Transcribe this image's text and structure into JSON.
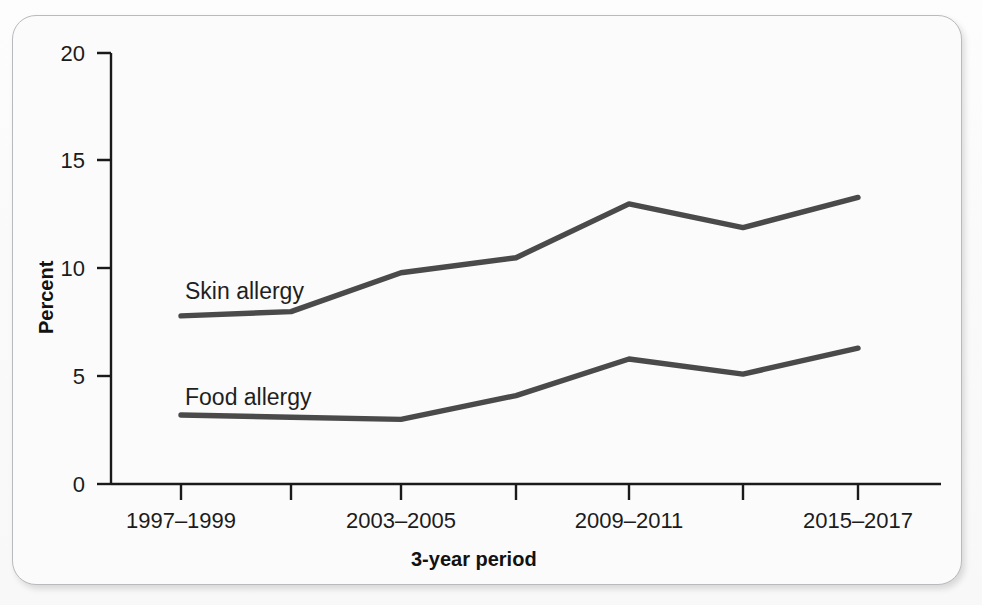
{
  "figure": {
    "background_color": "#fbfbfb",
    "border_color": "#b9babd",
    "line_color": "#4a4a4a",
    "axis_color": "#1a1a1a"
  },
  "axes": {
    "y_title": "Percent",
    "x_title": "3-year period",
    "y_ticks": [
      "20",
      "15",
      "10",
      "5",
      "0"
    ],
    "x_ticks": [
      "1997–1999",
      "",
      "2003–2005",
      "",
      "2009–2011",
      "",
      "2015–2017"
    ]
  },
  "series_labels": {
    "skin": "Skin allergy",
    "food": "Food allergy"
  },
  "chart_data": {
    "type": "line",
    "title": "",
    "subtitle": "",
    "xlabel": "3-year period",
    "ylabel": "Percent",
    "ylim": [
      0,
      20
    ],
    "yticks": [
      0,
      5,
      10,
      15,
      20
    ],
    "grid": false,
    "legend": "inline-labels",
    "categories": [
      "1997–1999",
      "2000–2002",
      "2003–2005",
      "2006–2008",
      "2009–2011",
      "2012–2014",
      "2015–2017"
    ],
    "xtick_labels_shown": [
      "1997–1999",
      "",
      "2003–2005",
      "",
      "2009–2011",
      "",
      "2015–2017"
    ],
    "series": [
      {
        "name": "Skin allergy",
        "color": "#4a4a4a",
        "values": [
          7.8,
          8.0,
          9.8,
          10.5,
          13.0,
          11.9,
          13.3
        ]
      },
      {
        "name": "Food allergy",
        "color": "#4a4a4a",
        "values": [
          3.2,
          3.1,
          3.0,
          4.1,
          5.8,
          5.1,
          6.3
        ]
      }
    ],
    "annotations": [
      {
        "text": "Skin allergy",
        "x_category": "1997–1999",
        "y": 9.1
      },
      {
        "text": "Food allergy",
        "x_category": "1997–1999",
        "y": 4.6
      }
    ]
  }
}
